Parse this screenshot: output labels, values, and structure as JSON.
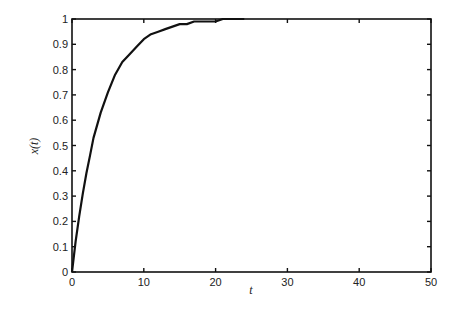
{
  "chart_data": {
    "type": "line",
    "title": "",
    "xlabel": "t",
    "ylabel": "x(t)",
    "xlim": [
      0,
      50
    ],
    "ylim": [
      0,
      1
    ],
    "grid": false,
    "legend": null,
    "xticks": [
      0,
      10,
      20,
      30,
      40,
      50
    ],
    "yticks": [
      0,
      0.1,
      0.2,
      0.3,
      0.4,
      0.5,
      0.6,
      0.7,
      0.8,
      0.9,
      1
    ],
    "xtick_labels": [
      "0",
      "10",
      "20",
      "30",
      "40",
      "50"
    ],
    "ytick_labels": [
      "0",
      "0.1",
      "0.2",
      "0.3",
      "0.4",
      "0.5",
      "0.6",
      "0.7",
      "0.8",
      "0.9",
      "1"
    ],
    "series": [
      {
        "name": "x(t)",
        "x": [
          0,
          0.5,
          1,
          1.5,
          2,
          2.5,
          3,
          4,
          5,
          6,
          7,
          8,
          9,
          10,
          11,
          12,
          13,
          14,
          15,
          16,
          17,
          18,
          19,
          20,
          21,
          22,
          23,
          24
        ],
        "values": [
          0,
          0.12,
          0.22,
          0.31,
          0.39,
          0.46,
          0.53,
          0.63,
          0.71,
          0.78,
          0.83,
          0.86,
          0.89,
          0.92,
          0.94,
          0.95,
          0.96,
          0.97,
          0.98,
          0.98,
          0.99,
          0.99,
          0.99,
          0.99,
          1.0,
          1.0,
          1.0,
          1.0
        ],
        "color": "#111111"
      }
    ]
  },
  "plot": {
    "left": 72,
    "right": 431,
    "top": 19,
    "bottom": 272
  }
}
